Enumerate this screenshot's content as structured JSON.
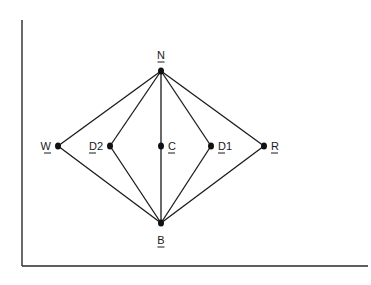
{
  "diagram": {
    "type": "lattice",
    "nodes": [
      {
        "id": "N",
        "label": "N",
        "x": 161,
        "y": 71,
        "label_pos": "above"
      },
      {
        "id": "W",
        "label": "W",
        "x": 58,
        "y": 146,
        "label_pos": "left"
      },
      {
        "id": "D2",
        "label": "D2",
        "x": 110,
        "y": 146,
        "label_pos": "left"
      },
      {
        "id": "C",
        "label": "C",
        "x": 161,
        "y": 146,
        "label_pos": "right"
      },
      {
        "id": "D1",
        "label": "D1",
        "x": 211,
        "y": 146,
        "label_pos": "right"
      },
      {
        "id": "R",
        "label": "R",
        "x": 264,
        "y": 146,
        "label_pos": "right"
      },
      {
        "id": "B",
        "label": "B",
        "x": 161,
        "y": 223,
        "label_pos": "below"
      }
    ],
    "edges": [
      [
        "N",
        "W"
      ],
      [
        "N",
        "D2"
      ],
      [
        "N",
        "C"
      ],
      [
        "N",
        "D1"
      ],
      [
        "N",
        "R"
      ],
      [
        "B",
        "W"
      ],
      [
        "B",
        "D2"
      ],
      [
        "B",
        "C"
      ],
      [
        "B",
        "D1"
      ],
      [
        "B",
        "R"
      ]
    ],
    "axes": {
      "left_x": 22,
      "top_y": 20,
      "bottom_y": 266,
      "right_x": 368
    },
    "colors": {
      "ink": "#1a1a1a",
      "background": "#ffffff"
    }
  }
}
